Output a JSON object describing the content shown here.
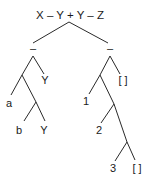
{
  "diagram": {
    "type": "parse-tree",
    "root": {
      "label": "X – Y + Y – Z",
      "operator": "+",
      "children": [
        "left",
        "right"
      ]
    },
    "nodes": {
      "root_label": "X – Y + Y – Z",
      "left_op": "–",
      "right_op": "–",
      "left_y": "Y",
      "a": "a",
      "b": "b",
      "left_y2": "Y",
      "right_nil1": "[ ]",
      "one": "1",
      "two": "2",
      "three": "3",
      "right_nil2": "[ ]"
    },
    "structure": {
      "left_subtree": {
        "label": "–",
        "children": [
          {
            "label": "(cons)",
            "children": [
              "a",
              {
                "label": "(cons)",
                "children": [
                  "b",
                  "Y"
                ]
              }
            ]
          },
          "Y"
        ]
      },
      "right_subtree": {
        "label": "–",
        "children": [
          {
            "label": "(cons)",
            "children": [
              "1",
              {
                "label": "(cons)",
                "children": [
                  "2",
                  {
                    "label": "(cons)",
                    "children": [
                      "3",
                      "[ ]"
                    ]
                  }
                ]
              }
            ]
          },
          "[ ]"
        ]
      }
    },
    "colors": {
      "line": "#2a2a2a",
      "text": "#1a1a1a",
      "background": "#ffffff"
    }
  }
}
